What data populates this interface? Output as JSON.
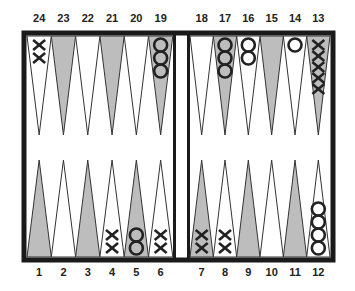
{
  "colors": {
    "frame": "#1a1a1a",
    "dark_point": "#bdbdbd",
    "light_point": "#ffffff",
    "checker": "#222222"
  },
  "top_labels": [
    "24",
    "23",
    "22",
    "21",
    "20",
    "19",
    "18",
    "17",
    "16",
    "15",
    "14",
    "13"
  ],
  "bottom_labels": [
    "1",
    "2",
    "3",
    "4",
    "5",
    "6",
    "7",
    "8",
    "9",
    "10",
    "11",
    "12"
  ],
  "points": [
    {
      "point": 1,
      "player": "",
      "count": 0
    },
    {
      "point": 2,
      "player": "",
      "count": 0
    },
    {
      "point": 3,
      "player": "",
      "count": 0
    },
    {
      "point": 4,
      "player": "X",
      "count": 2
    },
    {
      "point": 5,
      "player": "O",
      "count": 2
    },
    {
      "point": 6,
      "player": "X",
      "count": 2
    },
    {
      "point": 7,
      "player": "X",
      "count": 2
    },
    {
      "point": 8,
      "player": "X",
      "count": 2
    },
    {
      "point": 9,
      "player": "",
      "count": 0
    },
    {
      "point": 10,
      "player": "",
      "count": 0
    },
    {
      "point": 11,
      "player": "",
      "count": 0
    },
    {
      "point": 12,
      "player": "O",
      "count": 4
    },
    {
      "point": 13,
      "player": "X",
      "count": 5
    },
    {
      "point": 14,
      "player": "O",
      "count": 1
    },
    {
      "point": 15,
      "player": "",
      "count": 0
    },
    {
      "point": 16,
      "player": "O",
      "count": 2
    },
    {
      "point": 17,
      "player": "O",
      "count": 3
    },
    {
      "point": 18,
      "player": "",
      "count": 0
    },
    {
      "point": 19,
      "player": "O",
      "count": 3
    },
    {
      "point": 20,
      "player": "",
      "count": 0
    },
    {
      "point": 21,
      "player": "",
      "count": 0
    },
    {
      "point": 22,
      "player": "",
      "count": 0
    },
    {
      "point": 23,
      "player": "",
      "count": 0
    },
    {
      "point": 24,
      "player": "X",
      "count": 2
    }
  ]
}
